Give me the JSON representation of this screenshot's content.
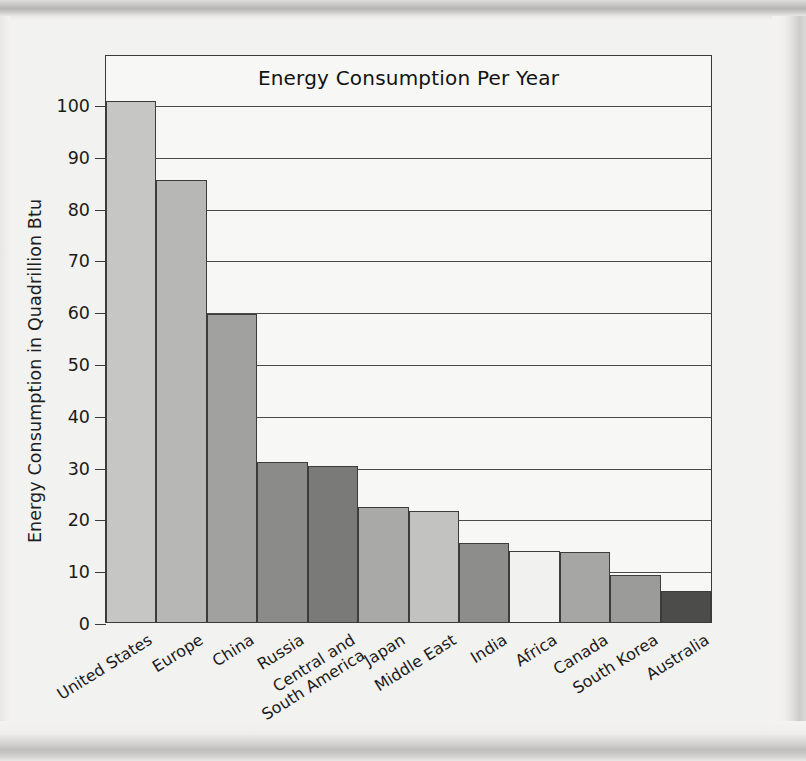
{
  "chart_data": {
    "type": "bar",
    "title": "Energy Consumption Per Year",
    "xlabel": "",
    "ylabel": "Energy Consumption in Quadrillion Btu",
    "ylim": [
      0,
      100
    ],
    "ytick_labels": [
      "100",
      "90",
      "80",
      "70",
      "60",
      "50",
      "40",
      "30",
      "20",
      "10",
      "0"
    ],
    "yticks": [
      100,
      90,
      80,
      70,
      60,
      50,
      40,
      30,
      20,
      10,
      0
    ],
    "grid": true,
    "legend": "none",
    "categories": [
      "United States",
      "Europe",
      "China",
      "Russia",
      "Central and South America",
      "Japan",
      "Middle East",
      "India",
      "Africa",
      "Canada",
      "South Korea",
      "Australia"
    ],
    "category_lines": [
      [
        "United States"
      ],
      [
        "Europe"
      ],
      [
        "China"
      ],
      [
        "Russia"
      ],
      [
        "Central and",
        "South America"
      ],
      [
        "Japan"
      ],
      [
        "Middle East"
      ],
      [
        "India"
      ],
      [
        "Africa"
      ],
      [
        "Canada"
      ],
      [
        "South Korea"
      ],
      [
        "Australia"
      ]
    ],
    "values": [
      100.5,
      85.3,
      59.5,
      30.8,
      30.1,
      22.2,
      21.4,
      15.2,
      13.7,
      13.5,
      9.1,
      6.0
    ],
    "bar_colors": [
      "#c6c6c4",
      "#b7b7b5",
      "#a1a1a0",
      "#8b8b8a",
      "#7a7a79",
      "#a9a9a8",
      "#c2c2c0",
      "#8d8d8c",
      "#f1f1ef",
      "#a6a6a5",
      "#9b9b9a",
      "#4c4c4b"
    ]
  },
  "figure": {
    "axis_color": "#3a3a3a",
    "grid_color": "#4a4a4a",
    "plot_background": "#f7f7f5",
    "page_background": "#f2f2f0",
    "text_color": "#1b1b1b"
  }
}
